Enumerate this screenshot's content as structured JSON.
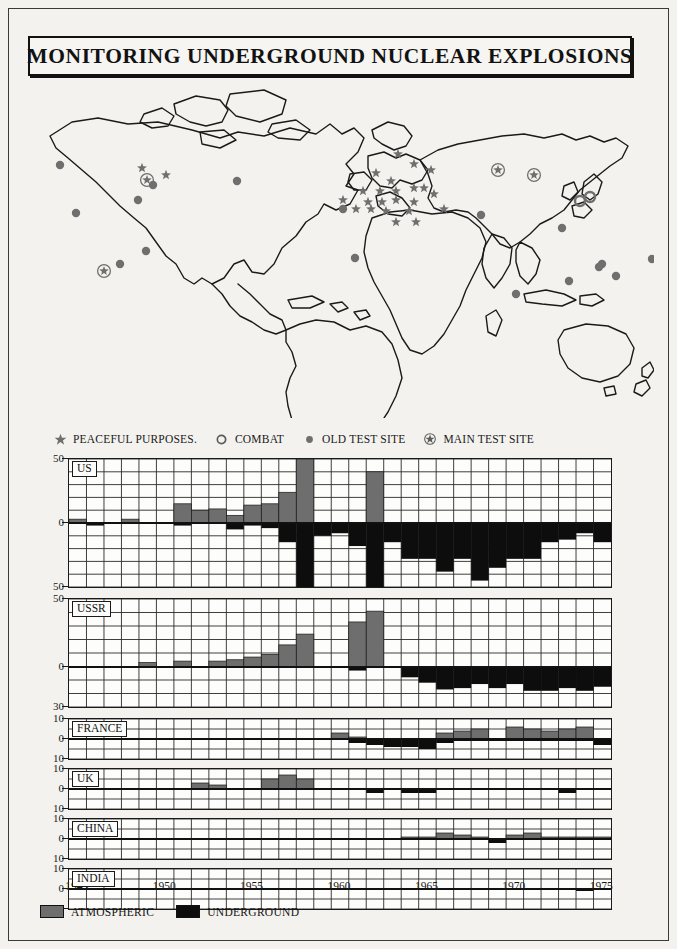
{
  "title": "MONITORING UNDERGROUND NUCLEAR EXPLOSIONS",
  "map_legend": [
    {
      "symbol": "star-icon",
      "label": "PEACEFUL PURPOSES."
    },
    {
      "symbol": "open-circle-icon",
      "label": "COMBAT"
    },
    {
      "symbol": "filled-dot-icon",
      "label": "OLD TEST SITE"
    },
    {
      "symbol": "circled-star-icon",
      "label": "MAIN TEST SITE"
    }
  ],
  "map_markers": {
    "peaceful_purposes": [
      [
        118,
        90
      ],
      [
        142,
        97
      ],
      [
        374,
        76
      ],
      [
        390,
        86
      ],
      [
        352,
        95
      ],
      [
        367,
        103
      ],
      [
        407,
        92
      ],
      [
        339,
        113
      ],
      [
        356,
        113
      ],
      [
        372,
        113
      ],
      [
        390,
        110
      ],
      [
        400,
        110
      ],
      [
        319,
        122
      ],
      [
        344,
        124
      ],
      [
        358,
        124
      ],
      [
        372,
        122
      ],
      [
        390,
        124
      ],
      [
        332,
        131
      ],
      [
        347,
        131
      ],
      [
        362,
        133
      ],
      [
        385,
        133
      ],
      [
        372,
        144
      ],
      [
        392,
        144
      ],
      [
        410,
        116
      ],
      [
        420,
        131
      ]
    ],
    "combat": [
      [
        556,
        123
      ],
      [
        566,
        119
      ]
    ],
    "old_test_site": [
      [
        36,
        87
      ],
      [
        129,
        107
      ],
      [
        114,
        122
      ],
      [
        52,
        135
      ],
      [
        213,
        103
      ],
      [
        96,
        186
      ],
      [
        122,
        173
      ],
      [
        319,
        131
      ],
      [
        331,
        180
      ],
      [
        457,
        137
      ],
      [
        538,
        150
      ],
      [
        578,
        186
      ],
      [
        637,
        146
      ],
      [
        628,
        181
      ],
      [
        592,
        198
      ],
      [
        545,
        203
      ],
      [
        492,
        216
      ],
      [
        575,
        189
      ]
    ],
    "main_test_site": [
      [
        123,
        102
      ],
      [
        80,
        193
      ],
      [
        474,
        92
      ],
      [
        510,
        97
      ]
    ]
  },
  "chart_data": [
    {
      "type": "bar",
      "country": "US",
      "title": "US",
      "xlabel": "",
      "ylabel": "",
      "ylim": [
        -50,
        50
      ],
      "yticks": [
        50,
        0,
        50
      ],
      "x": [
        1945,
        1946,
        1947,
        1948,
        1949,
        1950,
        1951,
        1952,
        1953,
        1954,
        1955,
        1956,
        1957,
        1958,
        1959,
        1960,
        1961,
        1962,
        1963,
        1964,
        1965,
        1966,
        1967,
        1968,
        1969,
        1970,
        1971,
        1972,
        1973,
        1974,
        1975
      ],
      "series": [
        {
          "name": "ATMOSPHERIC",
          "values": [
            3,
            0,
            0,
            3,
            0,
            0,
            15,
            10,
            11,
            6,
            14,
            15,
            24,
            50,
            0,
            0,
            0,
            40,
            0,
            0,
            0,
            0,
            0,
            0,
            0,
            0,
            0,
            0,
            0,
            0,
            0
          ]
        },
        {
          "name": "UNDERGROUND",
          "values": [
            0,
            -2,
            0,
            0,
            0,
            0,
            -2,
            0,
            0,
            -5,
            -2,
            -4,
            -15,
            -50,
            -10,
            -8,
            -18,
            -50,
            -15,
            -28,
            -28,
            -38,
            -28,
            -45,
            -35,
            -28,
            -28,
            -15,
            -13,
            -8,
            -15
          ]
        }
      ]
    },
    {
      "type": "bar",
      "country": "USSR",
      "title": "USSR",
      "xlabel": "",
      "ylabel": "",
      "ylim": [
        -30,
        50
      ],
      "yticks": [
        50,
        0,
        30
      ],
      "x": [
        1945,
        1946,
        1947,
        1948,
        1949,
        1950,
        1951,
        1952,
        1953,
        1954,
        1955,
        1956,
        1957,
        1958,
        1959,
        1960,
        1961,
        1962,
        1963,
        1964,
        1965,
        1966,
        1967,
        1968,
        1969,
        1970,
        1971,
        1972,
        1973,
        1974,
        1975
      ],
      "series": [
        {
          "name": "ATMOSPHERIC",
          "values": [
            0,
            0,
            0,
            0,
            3,
            0,
            4,
            0,
            4,
            5,
            7,
            9,
            16,
            24,
            0,
            0,
            33,
            41,
            0,
            0,
            0,
            0,
            0,
            0,
            0,
            0,
            0,
            0,
            0,
            0,
            0
          ]
        },
        {
          "name": "UNDERGROUND",
          "values": [
            0,
            0,
            0,
            0,
            0,
            0,
            0,
            0,
            0,
            0,
            0,
            0,
            0,
            0,
            0,
            0,
            -3,
            0,
            0,
            -8,
            -12,
            -17,
            -16,
            -13,
            -16,
            -13,
            -18,
            -18,
            -16,
            -18,
            -15
          ]
        }
      ]
    },
    {
      "type": "bar",
      "country": "FRANCE",
      "title": "FRANCE",
      "xlabel": "",
      "ylabel": "",
      "ylim": [
        -10,
        10
      ],
      "yticks": [
        10,
        0,
        10
      ],
      "x": [
        1945,
        1946,
        1947,
        1948,
        1949,
        1950,
        1951,
        1952,
        1953,
        1954,
        1955,
        1956,
        1957,
        1958,
        1959,
        1960,
        1961,
        1962,
        1963,
        1964,
        1965,
        1966,
        1967,
        1968,
        1969,
        1970,
        1971,
        1972,
        1973,
        1974,
        1975
      ],
      "series": [
        {
          "name": "ATMOSPHERIC",
          "values": [
            0,
            0,
            0,
            0,
            0,
            0,
            0,
            0,
            0,
            0,
            0,
            0,
            0,
            0,
            0,
            3,
            1,
            0,
            0,
            0,
            0,
            3,
            4,
            5,
            0,
            6,
            5,
            4,
            5,
            6,
            0
          ]
        },
        {
          "name": "UNDERGROUND",
          "values": [
            0,
            0,
            0,
            0,
            0,
            0,
            0,
            0,
            0,
            0,
            0,
            0,
            0,
            0,
            0,
            0,
            -2,
            -3,
            -4,
            -4,
            -5,
            -2,
            -1,
            -1,
            -1,
            -1,
            -1,
            -1,
            -1,
            -1,
            -3
          ]
        }
      ]
    },
    {
      "type": "bar",
      "country": "UK",
      "title": "UK",
      "xlabel": "",
      "ylabel": "",
      "ylim": [
        -10,
        10
      ],
      "yticks": [
        10,
        0,
        10
      ],
      "x": [
        1945,
        1946,
        1947,
        1948,
        1949,
        1950,
        1951,
        1952,
        1953,
        1954,
        1955,
        1956,
        1957,
        1958,
        1959,
        1960,
        1961,
        1962,
        1963,
        1964,
        1965,
        1966,
        1967,
        1968,
        1969,
        1970,
        1971,
        1972,
        1973,
        1974,
        1975
      ],
      "series": [
        {
          "name": "ATMOSPHERIC",
          "values": [
            0,
            0,
            0,
            0,
            0,
            0,
            0,
            3,
            2,
            0,
            0,
            5,
            7,
            5,
            0,
            0,
            0,
            0,
            0,
            0,
            0,
            0,
            0,
            0,
            0,
            0,
            0,
            0,
            0,
            0,
            0
          ]
        },
        {
          "name": "UNDERGROUND",
          "values": [
            0,
            0,
            0,
            0,
            0,
            0,
            0,
            0,
            0,
            0,
            0,
            0,
            0,
            0,
            0,
            0,
            0,
            -2,
            0,
            -2,
            -2,
            0,
            0,
            0,
            0,
            0,
            0,
            0,
            -2,
            0,
            0
          ]
        }
      ]
    },
    {
      "type": "bar",
      "country": "CHINA",
      "title": "CHINA",
      "xlabel": "",
      "ylabel": "",
      "ylim": [
        -10,
        10
      ],
      "yticks": [
        10,
        0,
        10
      ],
      "x": [
        1945,
        1946,
        1947,
        1948,
        1949,
        1950,
        1951,
        1952,
        1953,
        1954,
        1955,
        1956,
        1957,
        1958,
        1959,
        1960,
        1961,
        1962,
        1963,
        1964,
        1965,
        1966,
        1967,
        1968,
        1969,
        1970,
        1971,
        1972,
        1973,
        1974,
        1975
      ],
      "series": [
        {
          "name": "ATMOSPHERIC",
          "values": [
            0,
            0,
            0,
            0,
            0,
            0,
            0,
            0,
            0,
            0,
            0,
            0,
            0,
            0,
            0,
            0,
            0,
            0,
            0,
            1,
            1,
            3,
            2,
            1,
            0,
            2,
            3,
            1,
            1,
            1,
            1
          ]
        },
        {
          "name": "UNDERGROUND",
          "values": [
            0,
            0,
            0,
            0,
            0,
            0,
            0,
            0,
            0,
            0,
            0,
            0,
            0,
            0,
            0,
            0,
            0,
            0,
            0,
            0,
            0,
            0,
            0,
            0,
            -2,
            0,
            0,
            0,
            0,
            0,
            0
          ]
        }
      ]
    },
    {
      "type": "bar",
      "country": "INDIA",
      "title": "INDIA",
      "xlabel": "",
      "ylabel": "",
      "ylim": [
        -10,
        10
      ],
      "yticks": [
        10,
        0,
        10
      ],
      "x": [
        1945,
        1946,
        1947,
        1948,
        1949,
        1950,
        1951,
        1952,
        1953,
        1954,
        1955,
        1956,
        1957,
        1958,
        1959,
        1960,
        1961,
        1962,
        1963,
        1964,
        1965,
        1966,
        1967,
        1968,
        1969,
        1970,
        1971,
        1972,
        1973,
        1974,
        1975
      ],
      "series": [
        {
          "name": "ATMOSPHERIC",
          "values": [
            0,
            0,
            0,
            0,
            0,
            0,
            0,
            0,
            0,
            0,
            0,
            0,
            0,
            0,
            0,
            0,
            0,
            0,
            0,
            0,
            0,
            0,
            0,
            0,
            0,
            0,
            0,
            0,
            0,
            0,
            0
          ]
        },
        {
          "name": "UNDERGROUND",
          "values": [
            0,
            0,
            0,
            0,
            0,
            0,
            0,
            0,
            0,
            0,
            0,
            0,
            0,
            0,
            0,
            0,
            0,
            0,
            0,
            0,
            0,
            0,
            0,
            0,
            0,
            0,
            0,
            0,
            0,
            -1,
            0
          ]
        }
      ]
    }
  ],
  "xaxis": {
    "ticks": [
      "1945",
      "1950",
      "1955",
      "1960",
      "1965",
      "1970",
      "1975"
    ],
    "tick_values": [
      1945,
      1950,
      1955,
      1960,
      1965,
      1970,
      1975
    ],
    "range": [
      1945,
      1976
    ]
  },
  "bottom_legend": [
    {
      "label": "ATMOSPHERIC",
      "color": "#6e6e6e"
    },
    {
      "label": "UNDERGROUND",
      "color": "#0d0d0d"
    }
  ],
  "colors": {
    "atmospheric": "#6e6e6e",
    "underground": "#0d0d0d",
    "ink": "#1a1a1a",
    "paper": "#f3f2ee",
    "marker": "#6f6f6f"
  }
}
